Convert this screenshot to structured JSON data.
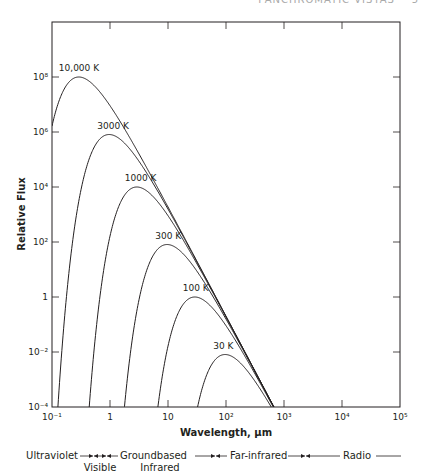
{
  "page": {
    "running_head": "PANCHROMATIC VISTAS",
    "page_number": "5"
  },
  "chart_data": {
    "type": "line",
    "title": "",
    "xlabel": "Wavelength, µm",
    "ylabel": "Relative Flux",
    "xscale": "log",
    "yscale": "log",
    "xlim": [
      0.1,
      100000
    ],
    "ylim": [
      0.0001,
      10000000000
    ],
    "grid": false,
    "x_ticks": [
      {
        "value": 0.1,
        "label": "10⁻¹"
      },
      {
        "value": 1,
        "label": "1"
      },
      {
        "value": 10,
        "label": "10"
      },
      {
        "value": 100,
        "label": "10²"
      },
      {
        "value": 1000,
        "label": "10³"
      },
      {
        "value": 10000,
        "label": "10⁴"
      },
      {
        "value": 100000,
        "label": "10⁵"
      }
    ],
    "y_ticks": [
      {
        "value": 0.0001,
        "label": "10⁻⁴"
      },
      {
        "value": 0.01,
        "label": "10⁻²"
      },
      {
        "value": 1,
        "label": "1"
      },
      {
        "value": 100,
        "label": "10²"
      },
      {
        "value": 10000,
        "label": "10⁴"
      },
      {
        "value": 1000000,
        "label": "10⁶"
      },
      {
        "value": 100000000,
        "label": "10⁸"
      }
    ],
    "series": [
      {
        "name": "10,000 K",
        "temperature_K": 10000,
        "peak_wavelength_um": 0.29,
        "peak_flux": 100000000.0
      },
      {
        "name": "3000 K",
        "temperature_K": 3000,
        "peak_wavelength_um": 0.97,
        "peak_flux": 810000.0
      },
      {
        "name": "1000 K",
        "temperature_K": 1000,
        "peak_wavelength_um": 2.9,
        "peak_flux": 10000.0
      },
      {
        "name": "300 K",
        "temperature_K": 300,
        "peak_wavelength_um": 9.7,
        "peak_flux": 81
      },
      {
        "name": "100 K",
        "temperature_K": 100,
        "peak_wavelength_um": 29,
        "peak_flux": 1.0
      },
      {
        "name": "30 K",
        "temperature_K": 30,
        "peak_wavelength_um": 97,
        "peak_flux": 0.0081
      }
    ],
    "legend": "curve labels placed at peaks",
    "bands": [
      {
        "label": "Ultraviolet",
        "row": 1
      },
      {
        "label": "Visible",
        "row": 2
      },
      {
        "label": "Groundbased",
        "row": 1
      },
      {
        "label": "Infrared",
        "row": 2
      },
      {
        "label": "Far-infrared",
        "row": 1
      },
      {
        "label": "Radio",
        "row": 1
      }
    ]
  }
}
